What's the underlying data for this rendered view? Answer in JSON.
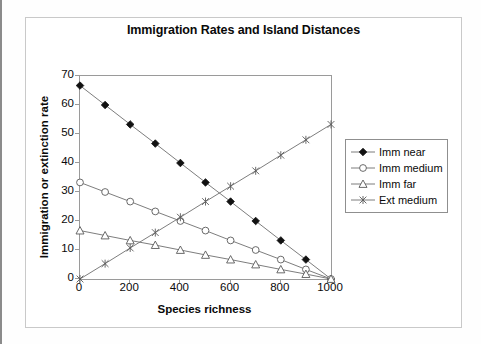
{
  "chart_data": {
    "type": "line",
    "title": "Immigration Rates and Island Distances",
    "xlabel": "Species richness",
    "ylabel": "Immigration or extinction rate",
    "x": [
      0,
      100,
      200,
      300,
      400,
      500,
      600,
      700,
      800,
      900,
      1000
    ],
    "xlim": [
      0,
      1000
    ],
    "ylim": [
      0,
      70
    ],
    "xticks": [
      0,
      200,
      400,
      600,
      800,
      1000
    ],
    "yticks": [
      0,
      10,
      20,
      30,
      40,
      50,
      60,
      70
    ],
    "grid": false,
    "legend_position": "right",
    "series": [
      {
        "name": "Imm near",
        "marker": "filled-diamond",
        "values": [
          66.7,
          60.0,
          53.3,
          46.7,
          40.0,
          33.3,
          26.7,
          20.0,
          13.3,
          6.7,
          0.0
        ]
      },
      {
        "name": "Imm medium",
        "marker": "open-circle",
        "values": [
          33.3,
          30.0,
          26.7,
          23.3,
          20.0,
          16.7,
          13.3,
          10.0,
          6.7,
          3.3,
          0.0
        ]
      },
      {
        "name": "Imm far",
        "marker": "open-triangle",
        "values": [
          16.7,
          15.0,
          13.3,
          11.7,
          10.0,
          8.3,
          6.7,
          5.0,
          3.3,
          1.7,
          0.0
        ]
      },
      {
        "name": "Ext medium",
        "marker": "cross-x",
        "values": [
          0.0,
          5.3,
          10.7,
          16.0,
          21.3,
          26.7,
          32.0,
          37.3,
          42.7,
          48.0,
          53.3
        ]
      }
    ]
  },
  "colors": {
    "line": "#6e6e6e",
    "marker_fill_dark": "#111111",
    "marker_stroke": "#5a5a5a",
    "axis": "#9a9a9a",
    "frame": "#c9c9c9",
    "text": "#0a0a0a",
    "page_edge": "#8b8b8b"
  }
}
